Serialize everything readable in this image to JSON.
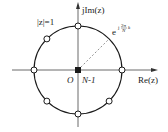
{
  "diagram": {
    "labels": {
      "imag_axis": "jIm(z)",
      "real_axis": "Re(z)",
      "unit_circle": "|z|=1",
      "origin": "O",
      "pole_order": "N-1",
      "root_base": "e",
      "root_exponent_j": "j",
      "root_exponent_num": "2π",
      "root_exponent_den": "N",
      "root_exponent_k": "k"
    },
    "zeros_angles_deg": [
      0,
      90,
      135,
      180,
      225,
      270,
      315
    ],
    "highlighted_angle_deg": 45,
    "colors": {
      "stroke": "#1a1a1a",
      "axis": "#444444",
      "dashed": "#777777",
      "marker_fill": "#ffffff"
    }
  }
}
